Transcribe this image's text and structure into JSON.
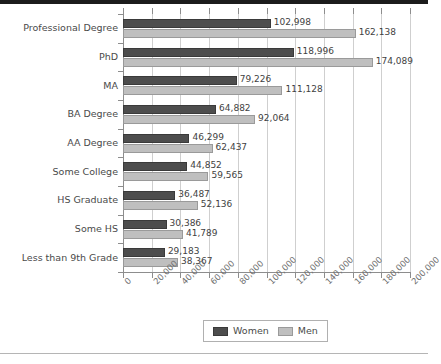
{
  "colors": {
    "women": "#4d4d4d",
    "men": "#bfbfbf",
    "gridline": "#cfcfcf",
    "axis": "#8d8d8d",
    "text": "#4a4a4a",
    "top_strip": "#1c1c1c",
    "bottom_rule": "#b5b5b5"
  },
  "chart_data": {
    "type": "bar",
    "orientation": "horizontal",
    "title": "",
    "subtitle": "",
    "xlabel": "",
    "ylabel": "",
    "grid": true,
    "legend_position": "bottom",
    "xlim": [
      0,
      200000
    ],
    "xticks": [
      0,
      20000,
      40000,
      60000,
      80000,
      100000,
      120000,
      140000,
      160000,
      180000,
      200000
    ],
    "xtick_labels": [
      "0",
      "20,000",
      "40,000",
      "60,000",
      "80,000",
      "100,000",
      "120,000",
      "140,000",
      "160,000",
      "180,000",
      "200,000"
    ],
    "categories": [
      "Professional Degree",
      "PhD",
      "MA",
      "BA Degree",
      "AA Degree",
      "Some College",
      "HS Graduate",
      "Some HS",
      "Less than 9th Grade"
    ],
    "series": [
      {
        "name": "Women",
        "color": "#4d4d4d",
        "values": [
          102998,
          118996,
          79226,
          64882,
          46299,
          44852,
          36487,
          30386,
          29183
        ],
        "labels": [
          "102,998",
          "118,996",
          "79,226",
          "64,882",
          "46,299",
          "44,852",
          "36,487",
          "30,386",
          "29,183"
        ]
      },
      {
        "name": "Men",
        "color": "#bfbfbf",
        "values": [
          162138,
          174089,
          111128,
          92064,
          62437,
          59565,
          52136,
          41789,
          38367
        ],
        "labels": [
          "162,138",
          "174,089",
          "111,128",
          "92,064",
          "62,437",
          "59,565",
          "52,136",
          "41,789",
          "38,367"
        ]
      }
    ]
  },
  "legend": {
    "items": [
      {
        "label": "Women",
        "color": "#4d4d4d"
      },
      {
        "label": "Men",
        "color": "#bfbfbf"
      }
    ]
  }
}
